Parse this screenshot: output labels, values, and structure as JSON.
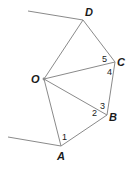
{
  "diagram": {
    "stroke_color": "#8a8a8a",
    "text_color": "#1a1a1a",
    "vertices": [
      {
        "id": "O",
        "label": "O",
        "x": 44,
        "y": 79,
        "lx": 31,
        "ly": 83
      },
      {
        "id": "A",
        "label": "A",
        "x": 61,
        "y": 146,
        "lx": 57,
        "ly": 160
      },
      {
        "id": "B",
        "label": "B",
        "x": 107,
        "y": 115,
        "lx": 109,
        "ly": 121
      },
      {
        "id": "C",
        "label": "C",
        "x": 115,
        "y": 62,
        "lx": 117,
        "ly": 66
      },
      {
        "id": "D",
        "label": "D",
        "x": 83,
        "y": 20,
        "lx": 85,
        "ly": 16
      }
    ],
    "edges": [
      {
        "from": "O",
        "to": "A"
      },
      {
        "from": "O",
        "to": "B"
      },
      {
        "from": "O",
        "to": "C"
      },
      {
        "from": "O",
        "to": "D"
      },
      {
        "from": "A",
        "to": "B"
      },
      {
        "from": "B",
        "to": "C"
      },
      {
        "from": "C",
        "to": "D"
      }
    ],
    "rays": [
      {
        "from": "D",
        "x2": 28,
        "y2": 11
      },
      {
        "from": "A",
        "x2": 8,
        "y2": 137
      }
    ],
    "angle_labels": [
      {
        "label": "1",
        "x": 62,
        "y": 140
      },
      {
        "label": "2",
        "x": 92,
        "y": 116
      },
      {
        "label": "3",
        "x": 100,
        "y": 109
      },
      {
        "label": "4",
        "x": 107,
        "y": 75
      },
      {
        "label": "5",
        "x": 102,
        "y": 62
      }
    ]
  }
}
